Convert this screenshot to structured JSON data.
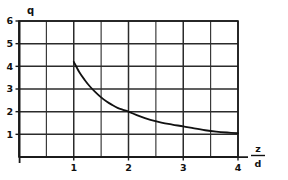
{
  "chart_data": {
    "type": "line",
    "title": "",
    "subtitle": "",
    "xlabel_numerator": "z",
    "xlabel_denominator": "d",
    "xlabel": "z/d",
    "ylabel": "q",
    "xlim": [
      0,
      4
    ],
    "ylim": [
      0,
      6
    ],
    "grid": true,
    "grid_x_step": 0.5,
    "grid_y_step": 1,
    "legend": "none",
    "x_tick_labels": [
      "1",
      "2",
      "3",
      "4"
    ],
    "x_tick_values": [
      1,
      2,
      3,
      4
    ],
    "y_tick_labels": [
      "1",
      "2",
      "3",
      "4",
      "5",
      "6"
    ],
    "y_tick_values": [
      1,
      2,
      3,
      4,
      5,
      6
    ],
    "series": [
      {
        "name": "q",
        "x": [
          1.0,
          1.1,
          1.2,
          1.3,
          1.4,
          1.5,
          1.6,
          1.7,
          1.8,
          1.9,
          2.0,
          2.2,
          2.4,
          2.6,
          2.8,
          3.0,
          3.2,
          3.4,
          3.6,
          3.8,
          4.0
        ],
        "values": [
          4.2,
          3.75,
          3.4,
          3.1,
          2.85,
          2.63,
          2.45,
          2.3,
          2.17,
          2.08,
          2.0,
          1.8,
          1.64,
          1.52,
          1.43,
          1.35,
          1.26,
          1.18,
          1.12,
          1.08,
          1.05
        ]
      }
    ],
    "annotations": []
  },
  "axes": {
    "y_axis_name": "q",
    "x_axis_numerator": "z",
    "x_axis_denominator": "d"
  },
  "colors": {
    "curve": "#111111",
    "grid": "#2b2b2b",
    "frame": "#1a1a1a",
    "background": "#ffffff",
    "text": "#111111"
  }
}
